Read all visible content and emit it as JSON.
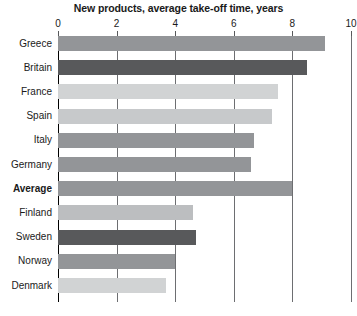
{
  "chart_data": {
    "type": "bar",
    "orientation": "horizontal",
    "title": "New products, average take-off time, years",
    "xlabel": "",
    "ylabel": "",
    "xlim": [
      0,
      10
    ],
    "xticks": [
      0,
      2,
      4,
      6,
      8,
      10
    ],
    "xtick_labels": [
      "0",
      "2",
      "4",
      "6",
      "8",
      "10"
    ],
    "grid": true,
    "legend": false,
    "legend_position": "none",
    "categories": [
      "Greece",
      "Britain",
      "France",
      "Spain",
      "Italy",
      "Germany",
      "Average",
      "Finland",
      "Sweden",
      "Norway",
      "Denmark"
    ],
    "values": [
      9.1,
      8.5,
      7.5,
      7.3,
      6.7,
      6.6,
      8.0,
      4.6,
      4.7,
      4.0,
      3.7
    ],
    "bar_colors": [
      "#939598",
      "#58595b",
      "#d1d3d4",
      "#c7c9cb",
      "#939598",
      "#939598",
      "#939598",
      "#bcbec0",
      "#58595b",
      "#939598",
      "#d1d3d4"
    ],
    "emphasis_category": "Average"
  },
  "colors": {
    "background": "#ffffff",
    "text": "#1a1a1a",
    "gridline": "#6d6e71",
    "axis": "#000000",
    "bar_medium": "#939598",
    "bar_dark": "#58595b",
    "bar_light": "#d1d3d4"
  }
}
